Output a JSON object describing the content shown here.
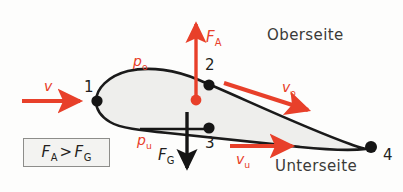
{
  "figure": {
    "title_alt": "Airfoil lift diagram (Tragflaeche)",
    "background_color": "#fdfdfc",
    "airfoil": {
      "fill_color": "#eeeeec",
      "outline_color": "#1a1a1a"
    },
    "colors": {
      "red": "#e8402a",
      "dark": "#231f20",
      "gray_text": "#3a3a38",
      "box_border": "#8d8d8a",
      "box_fill": "#f3f3f1"
    },
    "labels": {
      "oberseite": "Oberseite",
      "unterseite": "Unterseite",
      "point_1": "1",
      "point_2": "2",
      "point_3": "3",
      "point_4": "4"
    },
    "forces": {
      "lift": {
        "symbol": "F",
        "subscript": "A",
        "color": "#e8402a",
        "direction": "up"
      },
      "weight": {
        "symbol": "F",
        "subscript": "G",
        "color": "#231f20",
        "direction": "down"
      }
    },
    "pressures": {
      "upper": {
        "symbol": "p",
        "subscript": "o",
        "color": "#e8402a"
      },
      "lower": {
        "symbol": "p",
        "subscript": "u",
        "color": "#e8402a"
      }
    },
    "velocities": {
      "free_stream": {
        "symbol": "v",
        "subscript": "",
        "color": "#e8402a",
        "direction": "right"
      },
      "upper": {
        "symbol": "v",
        "subscript": "o",
        "color": "#e8402a",
        "direction": "right-down"
      },
      "lower": {
        "symbol": "v",
        "subscript": "u",
        "color": "#e8402a",
        "direction": "right"
      }
    },
    "relation_box": {
      "left_symbol": "F",
      "left_subscript": "A",
      "operator": ">",
      "right_symbol": "F",
      "right_subscript": "G"
    }
  }
}
